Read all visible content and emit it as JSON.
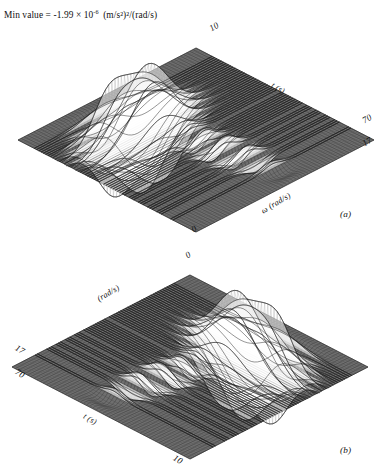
{
  "figure": {
    "header_note": {
      "prefix": "Min value  =  -1.99 × 10",
      "exponent": "-6",
      "units": "(m/s²)²/(rad/s)",
      "full_text": "Min value  =  -1.99 × 10⁻⁶ (m/s²)²/(rad/s)"
    },
    "style": {
      "mesh_color": "#2b2b2b",
      "surface_fill": "#6f6f6f",
      "spike_color": "#1a1a1a",
      "background": "#ffffff",
      "page_text_color": "#111111"
    }
  },
  "panels": [
    {
      "id": "a",
      "subfig_label": "(a)",
      "vertices": {
        "top": "10",
        "right_upper": "70",
        "right_lower": "17",
        "bottom": "0"
      },
      "edge_labels": {
        "upper_right": "t (s)",
        "lower_right": "ω (rad/s)"
      },
      "view": {
        "azimuth_deg": -31,
        "elevation_deg": 31,
        "orientation": "time-axis-receding-right"
      }
    },
    {
      "id": "b",
      "subfig_label": "(b)",
      "vertices": {
        "top": "0",
        "left_upper": "17",
        "left_lower": "70",
        "bottom": "10"
      },
      "edge_labels": {
        "upper_left": "(rad/s)",
        "lower_left": "t (s)"
      },
      "view": {
        "azimuth_deg": 31,
        "elevation_deg": 31,
        "orientation": "mirrored-time-axis-receding-left"
      }
    }
  ],
  "chart_data": {
    "type": "surface",
    "title": "",
    "xlabel": "t (s)",
    "ylabel": "ω (rad/s)",
    "zlabel": "(m/s²)²/(rad/s)",
    "xlim": [
      0,
      10
    ],
    "ylim": [
      17,
      70
    ],
    "grid": true,
    "legend": null,
    "annotations": [
      "Min value  =  -1.99 × 10⁻⁶ (m/s²)²/(rad/s)"
    ],
    "min_value": -1.99e-06,
    "mesh": {
      "nx": 78,
      "ny": 58
    },
    "packets": [
      {
        "name": "main-burst",
        "t": 2.55,
        "w": 41.0,
        "amp": 1.0,
        "sigma_t": 0.62,
        "sigma_w": 6.4,
        "osc_cycles": 9.5
      },
      {
        "name": "second-burst",
        "t": 3.55,
        "w": 38.0,
        "amp": 0.62,
        "sigma_t": 0.5,
        "sigma_w": 5.2,
        "osc_cycles": 8.0
      },
      {
        "name": "early-ripple",
        "t": 1.7,
        "w": 36.5,
        "amp": 0.3,
        "sigma_t": 0.52,
        "sigma_w": 5.8,
        "osc_cycles": 7.0
      },
      {
        "name": "negative-lobe",
        "t": 2.75,
        "w": 30.5,
        "amp": -0.58,
        "sigma_t": 0.6,
        "sigma_w": 4.6,
        "osc_cycles": 8.5
      },
      {
        "name": "interference-tail",
        "t": 5.4,
        "w": 44.0,
        "amp": 0.22,
        "sigma_t": 1.45,
        "sigma_w": 3.2,
        "osc_cycles": 5.0
      },
      {
        "name": "far-tail",
        "t": 7.4,
        "w": 46.5,
        "amp": 0.1,
        "sigma_t": 1.5,
        "sigma_w": 2.6,
        "osc_cycles": 4.0
      }
    ]
  }
}
